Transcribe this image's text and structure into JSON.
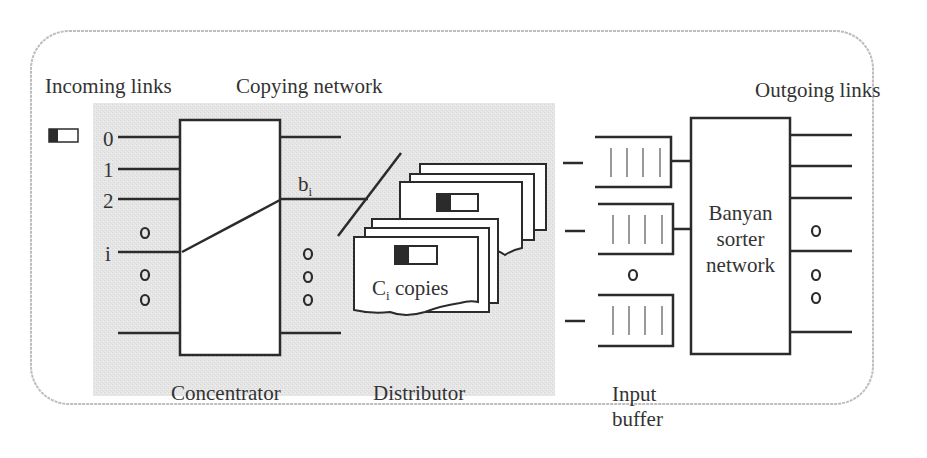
{
  "diagram": {
    "title_labels": {
      "incoming_links": "Incoming links",
      "copying_network": "Copying network",
      "outgoing_links": "Outgoing links"
    },
    "input_indices": [
      "0",
      "1",
      "2",
      "i"
    ],
    "signal_label": {
      "base": "b",
      "sub": "i"
    },
    "copies_label": {
      "base": "C",
      "sub": "i",
      "rest": " copies"
    },
    "concentrator_label": "Concentrator",
    "distributor_label": "Distributor",
    "input_buffer_label_line1": "Input",
    "input_buffer_label_line2": "buffer",
    "banyan_label_line1": "Banyan",
    "banyan_label_line2": "sorter",
    "banyan_label_line3": "network",
    "colors": {
      "shaded_region": "#e4e4e4",
      "stroke": "#2b2b2b",
      "frame_border": "#bdbdbd"
    }
  }
}
